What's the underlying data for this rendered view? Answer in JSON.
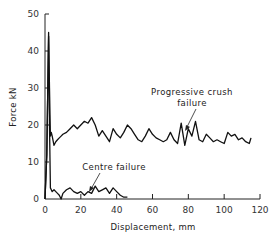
{
  "chart_data": {
    "type": "line",
    "title": "",
    "xlabel": "Displacement, mm",
    "ylabel": "Force kN",
    "xlim": [
      0,
      120
    ],
    "ylim": [
      0,
      50
    ],
    "xticks": [
      0,
      20,
      40,
      60,
      80,
      100,
      120
    ],
    "yticks": [
      0,
      10,
      20,
      30,
      40,
      50
    ],
    "grid": false,
    "legend": null,
    "series": [
      {
        "name": "Progressive crush failure",
        "x": [
          0,
          1,
          2,
          2.5,
          3,
          3.5,
          4,
          5,
          6,
          7,
          8,
          9,
          10,
          12,
          14,
          16,
          18,
          20,
          22,
          24,
          26,
          28,
          30,
          32,
          34,
          36,
          38,
          40,
          42,
          44,
          46,
          48,
          50,
          52,
          54,
          56,
          58,
          60,
          62,
          64,
          66,
          68,
          70,
          72,
          74,
          76,
          78,
          80,
          82,
          84,
          86,
          88,
          90,
          92,
          94,
          96,
          98,
          100,
          102,
          104,
          106,
          108,
          110,
          112,
          114,
          115
        ],
        "values": [
          0,
          12,
          45,
          30,
          17,
          18,
          17,
          14.5,
          15.5,
          16,
          16.5,
          17,
          17.5,
          18,
          19,
          20,
          19,
          20,
          21,
          20.5,
          22,
          20,
          17,
          18.5,
          17,
          15.5,
          19,
          17.5,
          16.5,
          18,
          20,
          19,
          17.5,
          16,
          15.5,
          17,
          19,
          17.5,
          16.5,
          16,
          15.5,
          16,
          18,
          16,
          15,
          20.5,
          14.5,
          19,
          17,
          21,
          16,
          15.5,
          17.5,
          16.5,
          15.5,
          16,
          15.5,
          15,
          18,
          17,
          17.5,
          16,
          16.5,
          15.5,
          15,
          16.5
        ]
      },
      {
        "name": "Centre failure",
        "x": [
          0,
          1,
          2,
          2.5,
          3,
          3.5,
          4,
          5,
          6,
          7,
          8,
          9,
          10,
          12,
          14,
          16,
          18,
          20,
          22,
          24,
          26,
          28,
          30,
          32,
          34,
          36,
          38,
          40,
          42,
          44,
          46
        ],
        "values": [
          0,
          12,
          44,
          20,
          3,
          2.5,
          2,
          2.5,
          2,
          1.5,
          1,
          0,
          1.5,
          2.5,
          3,
          2,
          1.5,
          2,
          1,
          2,
          1.5,
          3.5,
          2,
          2.5,
          3,
          1.5,
          3,
          2,
          1,
          0.5,
          0.5
        ]
      }
    ],
    "annotations": [
      {
        "text": "Progressive crush failure",
        "arrow_to": [
          79,
          19
        ]
      },
      {
        "text": "Centre failure",
        "arrow_to": [
          24,
          2
        ]
      }
    ]
  },
  "labels": {
    "y_axis": "Force kN",
    "x_axis": "Displacement, mm",
    "annot_prog_line1": "Progressive  crush",
    "annot_prog_line2": "failure",
    "annot_centre": "Centre  failure",
    "yticks": [
      "0",
      "10",
      "20",
      "30",
      "40",
      "50"
    ],
    "xticks": [
      "0",
      "20",
      "40",
      "60",
      "80",
      "100",
      "120"
    ]
  }
}
